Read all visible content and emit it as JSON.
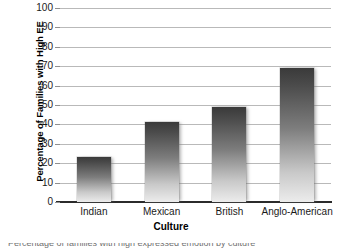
{
  "chart_data": {
    "type": "bar",
    "title": "",
    "xlabel": "Culture",
    "ylabel": "Percentage of Families with High EE",
    "categories": [
      "Indian",
      "Mexican",
      "British",
      "Anglo-American"
    ],
    "values": [
      23,
      41,
      49,
      69
    ],
    "ylim": [
      0,
      100
    ],
    "ytick_values": [
      0,
      10,
      20,
      30,
      40,
      50,
      60,
      70,
      80,
      90,
      100
    ],
    "ytick_labels": [
      "0",
      "10",
      "20",
      "30",
      "40",
      "50",
      "60",
      "70",
      "80",
      "90",
      "100"
    ],
    "grid": "horizontal",
    "legend": "none",
    "series": [
      {
        "name": "Percentage of Families with High EE",
        "values": [
          23,
          41,
          49,
          69
        ]
      }
    ],
    "bar_fill": "vertical-gradient-dark-top-light-bottom",
    "colors": {
      "bar_top": "#3a3a3a",
      "bar_bottom": "#ececec",
      "gridline": "#b9b9b9",
      "axis": "#2b2b2b",
      "text": "#1a1a1a"
    }
  },
  "caption": {
    "clipped_line": "Percentage of families with high expressed emotion by culture"
  }
}
